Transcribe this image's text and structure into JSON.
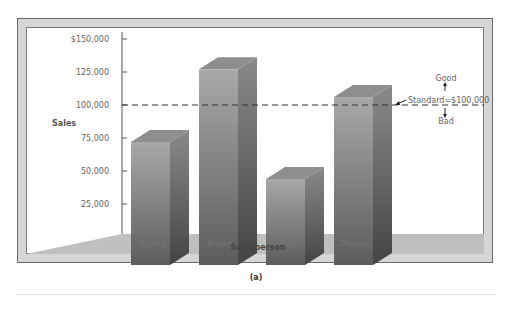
{
  "chart_data": {
    "type": "bar",
    "style": "3d",
    "title": "",
    "xlabel": "Salesperson",
    "ylabel": "Sales",
    "categories": [
      "Adams",
      "Brown",
      "Davis",
      "Thomas"
    ],
    "values": [
      72000,
      127000,
      44000,
      106000
    ],
    "ylim": [
      0,
      150000
    ],
    "yticks": [
      25000,
      50000,
      75000,
      100000,
      125000,
      150000
    ],
    "ytick_labels": [
      "25,000",
      "50,000",
      "75,000",
      "100,000",
      "125,000",
      "$150,000"
    ],
    "grid": false,
    "legend": null,
    "reference_line": {
      "value": 100000,
      "style": "dashed",
      "label": "Standard=$100,000"
    },
    "annotations": [
      {
        "text": "Good",
        "direction": "up"
      },
      {
        "text": "Bad",
        "direction": "down"
      }
    ]
  },
  "caption": "(a)",
  "colors": {
    "frame": "#d6d6d6",
    "floor": "#bdbdbd",
    "bar_front": "#8a8a8a",
    "bar_top": "#9a9a9a",
    "bar_side": "#6e6e6e",
    "text": "#666666"
  }
}
